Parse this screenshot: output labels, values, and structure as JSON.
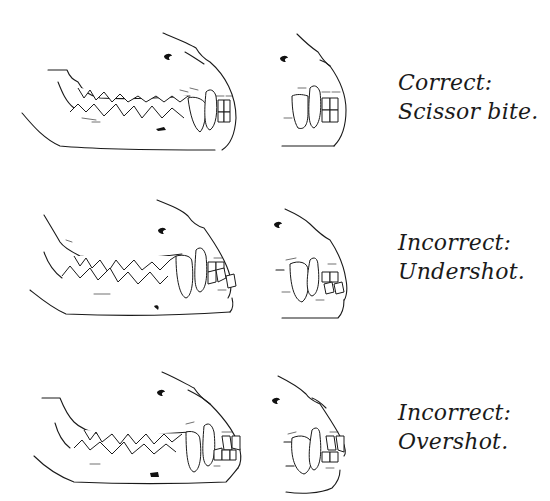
{
  "figure": {
    "rows": [
      {
        "id": "scissor",
        "status": "Correct:",
        "bite": "Scissor bite.",
        "views": [
          "side-view",
          "front-view"
        ]
      },
      {
        "id": "undershot",
        "status": "Incorrect:",
        "bite": "Undershot.",
        "views": [
          "side-view",
          "front-view"
        ]
      },
      {
        "id": "overshot",
        "status": "Incorrect:",
        "bite": "Overshot.",
        "views": [
          "side-view",
          "front-view"
        ]
      }
    ]
  },
  "colors": {
    "background": "#ffffff",
    "ink": "#1a1a1a"
  }
}
